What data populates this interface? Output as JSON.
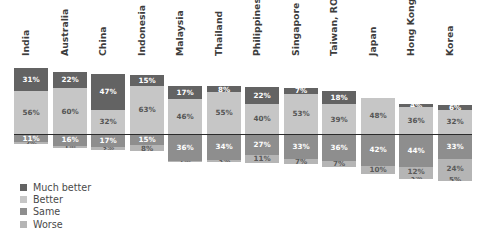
{
  "chart_data": {
    "type": "bar",
    "subtype": "diverging-stacked-bar",
    "title": "",
    "xlabel": "",
    "ylabel": "",
    "orientation": "vertical",
    "baseline": 0,
    "grid": false,
    "legend_position": "bottom-left",
    "unit": "%",
    "categories": [
      "India",
      "Australia",
      "China",
      "Indonesia",
      "Malaysia",
      "Thailand",
      "Philippines",
      "Singapore",
      "Taiwan, ROC",
      "Japan",
      "Hong Kong",
      "Korea"
    ],
    "series": [
      {
        "name": "Much better",
        "color": "#636363",
        "direction": "positive",
        "values": [
          31,
          22,
          47,
          15,
          17,
          8,
          22,
          7,
          18,
          0,
          4,
          6
        ],
        "labels": [
          "31%",
          "22%",
          "47%",
          "15%",
          "17%",
          "8%",
          "22%",
          "7%",
          "18%",
          "",
          "4%",
          "6%"
        ]
      },
      {
        "name": "Better",
        "color": "#c6c6c6",
        "direction": "positive",
        "values": [
          56,
          60,
          32,
          63,
          46,
          55,
          40,
          53,
          39,
          48,
          36,
          32
        ],
        "labels": [
          "56%",
          "60%",
          "32%",
          "63%",
          "46%",
          "55%",
          "40%",
          "53%",
          "39%",
          "48%",
          "36%",
          "32%"
        ]
      },
      {
        "name": "Same",
        "color": "#8e8e8e",
        "direction": "negative",
        "values": [
          11,
          16,
          17,
          15,
          36,
          34,
          27,
          33,
          36,
          42,
          44,
          33
        ],
        "labels": [
          "11%",
          "16%",
          "17%",
          "15%",
          "36%",
          "34%",
          "27%",
          "33%",
          "36%",
          "42%",
          "44%",
          "33%"
        ]
      },
      {
        "name": "Worse",
        "color": "#b5b5b5",
        "direction": "negative",
        "values": [
          2,
          1,
          3,
          8,
          1,
          3,
          11,
          7,
          7,
          10,
          12,
          24
        ],
        "labels": [
          "2%",
          "1%",
          "3%",
          "8%",
          "1%",
          "3%",
          "11%",
          "7%",
          "7%",
          "10%",
          "12%",
          "24%"
        ]
      },
      {
        "name": "Worse-extra",
        "color": "#c9c9c9",
        "direction": "negative",
        "values": [
          0,
          1,
          1,
          0,
          0,
          0,
          0,
          0,
          0,
          0,
          3,
          5
        ],
        "labels": [
          "",
          "1%",
          "1%",
          "",
          "",
          "",
          "",
          "",
          "",
          "",
          "3%",
          "5%"
        ]
      }
    ],
    "legend": [
      {
        "label": "Much better",
        "color": "#636363"
      },
      {
        "label": "Better",
        "color": "#c6c6c6"
      },
      {
        "label": "Same",
        "color": "#8e8e8e"
      },
      {
        "label": "Worse",
        "color": "#b5b5b5"
      }
    ]
  }
}
